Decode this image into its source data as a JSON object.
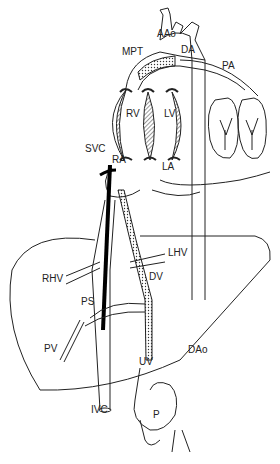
{
  "diagram": {
    "labels": [
      {
        "id": "aao",
        "text": "AAo",
        "x": 157,
        "y": 37
      },
      {
        "id": "mpt",
        "text": "MPT",
        "x": 122,
        "y": 55
      },
      {
        "id": "da",
        "text": "DA",
        "x": 181,
        "y": 53
      },
      {
        "id": "pa",
        "text": "PA",
        "x": 222,
        "y": 69
      },
      {
        "id": "rv",
        "text": "RV",
        "x": 126,
        "y": 117
      },
      {
        "id": "lv",
        "text": "LV",
        "x": 164,
        "y": 117
      },
      {
        "id": "svc",
        "text": "SVC",
        "x": 85,
        "y": 152
      },
      {
        "id": "ra",
        "text": "RA",
        "x": 112,
        "y": 163
      },
      {
        "id": "la",
        "text": "LA",
        "x": 162,
        "y": 170
      },
      {
        "id": "lhv",
        "text": "LHV",
        "x": 168,
        "y": 256
      },
      {
        "id": "rhv",
        "text": "RHV",
        "x": 42,
        "y": 282
      },
      {
        "id": "dv",
        "text": "DV",
        "x": 149,
        "y": 280
      },
      {
        "id": "ps",
        "text": "PS",
        "x": 81,
        "y": 305
      },
      {
        "id": "pv",
        "text": "PV",
        "x": 44,
        "y": 352
      },
      {
        "id": "dao",
        "text": "DAo",
        "x": 188,
        "y": 353
      },
      {
        "id": "uv",
        "text": "UV",
        "x": 139,
        "y": 365
      },
      {
        "id": "ivc",
        "text": "IVC",
        "x": 91,
        "y": 413
      },
      {
        "id": "p",
        "text": "P",
        "x": 153,
        "y": 418
      }
    ]
  }
}
